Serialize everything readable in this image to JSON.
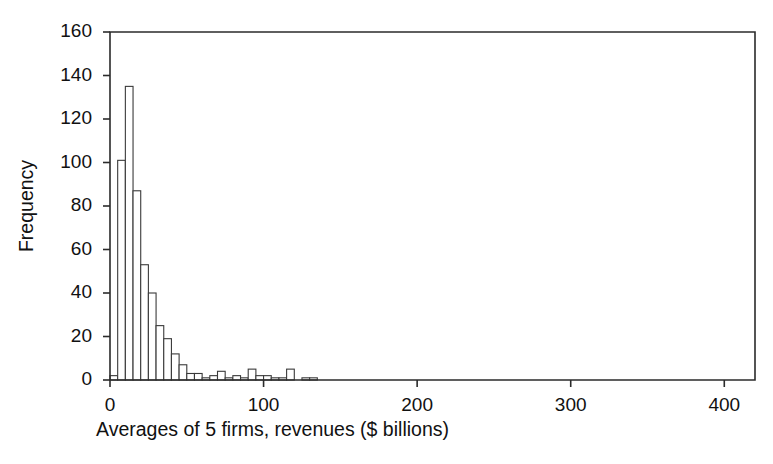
{
  "chart_data": {
    "type": "bar",
    "title": "",
    "subtitle": "",
    "xlabel": "Averages of 5 firms, revenues ($ billions)",
    "ylabel": "Frequency",
    "xlim": [
      0,
      420
    ],
    "ylim": [
      0,
      160
    ],
    "xticks": [
      0,
      100,
      200,
      300,
      400
    ],
    "yticks": [
      0,
      20,
      40,
      60,
      80,
      100,
      120,
      140,
      160
    ],
    "xtick_labels": [
      "0",
      "100",
      "200",
      "300",
      "400"
    ],
    "ytick_labels": [
      "0",
      "20",
      "40",
      "60",
      "80",
      "100",
      "120",
      "140",
      "160"
    ],
    "grid": false,
    "legend": false,
    "legend_position": "none",
    "bar_fill_color": "#ffffff",
    "bar_edge_color": "#3a3a3a",
    "bin_width": 5,
    "bin_starts": [
      0,
      5,
      10,
      15,
      20,
      25,
      30,
      35,
      40,
      45,
      50,
      55,
      60,
      65,
      70,
      75,
      80,
      85,
      90,
      95,
      100,
      105,
      110,
      115,
      120,
      125,
      130
    ],
    "categories": [
      "0-5",
      "5-10",
      "10-15",
      "15-20",
      "20-25",
      "25-30",
      "30-35",
      "35-40",
      "40-45",
      "45-50",
      "50-55",
      "55-60",
      "60-65",
      "65-70",
      "70-75",
      "75-80",
      "80-85",
      "85-90",
      "90-95",
      "95-100",
      "100-105",
      "105-110",
      "110-115",
      "115-120",
      "120-125",
      "125-130",
      "130-135"
    ],
    "values": [
      2,
      101,
      135,
      87,
      53,
      40,
      25,
      19,
      12,
      7,
      3,
      3,
      1,
      2,
      4,
      1,
      2,
      1,
      5,
      2,
      2,
      1,
      1,
      5,
      0,
      1,
      1
    ]
  },
  "geometry": {
    "plot_left": 110,
    "plot_right": 755,
    "plot_top": 32,
    "plot_bottom": 380,
    "tick_len": 7,
    "xtick_label_offset": 10,
    "ytick_label_offset": 11,
    "xlabel_y": 436,
    "ylabel_x": 33
  }
}
